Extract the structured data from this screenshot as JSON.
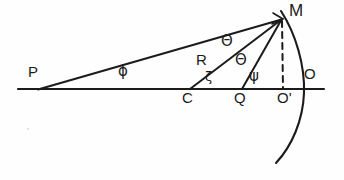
{
  "figure": {
    "kind": "optics-ray-geometry-diagram",
    "background_color": "#fefefe",
    "ink_color": "#1b1b1b"
  },
  "labels": {
    "p": "P",
    "c": "C",
    "q": "Q",
    "o_prime": "O'",
    "o": "O",
    "m": "M",
    "phi": "ϕ",
    "zeta": "ζ",
    "theta_upper": "Θ",
    "theta_lower": "Θ",
    "psi": "ψ",
    "radius": "R"
  },
  "geometry": {
    "baseline": {
      "x1": 18,
      "y1": 89,
      "x2": 324,
      "y2": 89
    },
    "points": {
      "P": {
        "x": 38,
        "y": 89
      },
      "C": {
        "x": 190,
        "y": 89
      },
      "Q": {
        "x": 242,
        "y": 89
      },
      "O_prime": {
        "x": 283,
        "y": 89
      },
      "O": {
        "x": 303,
        "y": 89
      },
      "M": {
        "x": 282,
        "y": 19
      }
    },
    "rays": [
      {
        "name": "P-to-M",
        "from": "P",
        "to": "M"
      },
      {
        "name": "C-to-M",
        "from": "C",
        "to": "M",
        "label": "R"
      },
      {
        "name": "Q-to-M",
        "from": "Q",
        "to": "M"
      }
    ],
    "dashed": {
      "name": "M-to-O-prime",
      "x1": 282,
      "y1": 20,
      "x2": 283,
      "y2": 89
    },
    "arc": {
      "name": "mirror-arc",
      "top": {
        "x": 281,
        "y": 11
      },
      "bulge": {
        "x": 304,
        "y": 92
      },
      "bottom": {
        "x": 276,
        "y": 163
      }
    }
  },
  "label_positions": {
    "p": {
      "x": 28,
      "y": 66
    },
    "phi": {
      "x": 118,
      "y": 65
    },
    "c": {
      "x": 182,
      "y": 91
    },
    "zeta": {
      "x": 205,
      "y": 71
    },
    "radius": {
      "x": 196,
      "y": 53
    },
    "theta_upper": {
      "x": 221,
      "y": 36
    },
    "theta_lower": {
      "x": 235,
      "y": 54
    },
    "q": {
      "x": 234,
      "y": 91
    },
    "psi": {
      "x": 249,
      "y": 69
    },
    "o_prime": {
      "x": 277,
      "y": 91
    },
    "o": {
      "x": 304,
      "y": 67
    },
    "m": {
      "x": 289,
      "y": 3
    }
  }
}
